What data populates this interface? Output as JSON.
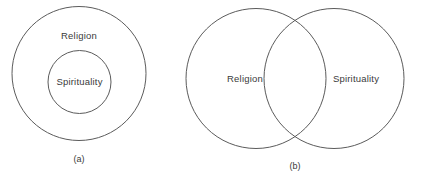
{
  "figure": {
    "background_color": "#ffffff",
    "stroke_color": "#5b5b5b",
    "text_color": "#3a3a3a",
    "panels": [
      {
        "id": "panel-a",
        "caption": "(a)",
        "caption_x": 79,
        "caption_y": 160,
        "relationship": "nested",
        "circles": [
          {
            "label": "Religion",
            "cx": 79,
            "cy": 73.5,
            "r": 67,
            "label_x": 79,
            "label_y": 36
          },
          {
            "label": "Spirituality",
            "cx": 79.5,
            "cy": 82,
            "r": 31.5,
            "label_x": 79.5,
            "label_y": 82
          }
        ]
      },
      {
        "id": "panel-b",
        "caption": "(b)",
        "caption_x": 295,
        "caption_y": 167,
        "relationship": "overlapping",
        "circles": [
          {
            "label": "Religion",
            "cx": 256,
            "cy": 78.5,
            "r": 70,
            "label_x": 245,
            "label_y": 79
          },
          {
            "label": "Spirituality",
            "cx": 334,
            "cy": 78.5,
            "r": 70,
            "label_x": 356,
            "label_y": 79
          }
        ]
      }
    ]
  }
}
